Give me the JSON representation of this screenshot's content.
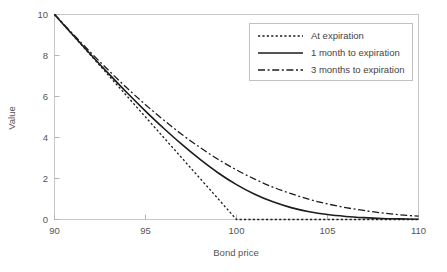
{
  "chart_data": {
    "type": "line",
    "title": "",
    "xlabel": "Bond price",
    "ylabel": "Value",
    "xlim": [
      90,
      110
    ],
    "ylim": [
      0,
      10
    ],
    "xticks": [
      90,
      95,
      100,
      105,
      110
    ],
    "yticks": [
      0,
      2,
      4,
      6,
      8,
      10
    ],
    "xtick_labels": [
      "90",
      "95",
      "100",
      "105",
      "110"
    ],
    "ytick_labels": [
      "0",
      "2",
      "4",
      "6",
      "8",
      "10"
    ],
    "grid": false,
    "legend_position": "top-right",
    "frame": "box",
    "x": [
      90,
      91,
      92,
      93,
      94,
      95,
      96,
      97,
      98,
      99,
      100,
      101,
      102,
      103,
      104,
      105,
      106,
      107,
      108,
      109,
      110
    ],
    "series": [
      {
        "name": "At expiration",
        "style": "dotted",
        "color": "#1c1c1c",
        "values": [
          10.0,
          9.0,
          8.0,
          7.0,
          6.0,
          5.0,
          4.0,
          3.0,
          2.0,
          1.0,
          0.0,
          0.0,
          0.0,
          0.0,
          0.0,
          0.0,
          0.0,
          0.0,
          0.0,
          0.0,
          0.0
        ]
      },
      {
        "name": "1 month to expiration",
        "style": "solid",
        "color": "#1c1c1c",
        "values": [
          10.0,
          9.01,
          8.04,
          7.09,
          6.17,
          5.29,
          4.45,
          3.66,
          2.93,
          2.27,
          1.7,
          1.23,
          0.86,
          0.58,
          0.38,
          0.24,
          0.15,
          0.09,
          0.05,
          0.03,
          0.01
        ]
      },
      {
        "name": "3 months to expiration",
        "style": "dashdot",
        "color": "#1c1c1c",
        "values": [
          10.02,
          9.06,
          8.14,
          7.25,
          6.4,
          5.6,
          4.85,
          4.15,
          3.51,
          2.93,
          2.42,
          1.97,
          1.58,
          1.26,
          0.98,
          0.76,
          0.58,
          0.44,
          0.32,
          0.23,
          0.16
        ]
      }
    ]
  },
  "legend": {
    "entries": [
      {
        "label": "At expiration",
        "style": "dotted"
      },
      {
        "label": "1 month to expiration",
        "style": "solid"
      },
      {
        "label": "3 months to expiration",
        "style": "dashdot"
      }
    ]
  },
  "axes": {
    "x_title": "Bond price",
    "y_title": "Value"
  },
  "colors": {
    "line": "#1c1c1c",
    "frame": "#c8c8c8",
    "text": "#555555",
    "background": "#ffffff"
  }
}
